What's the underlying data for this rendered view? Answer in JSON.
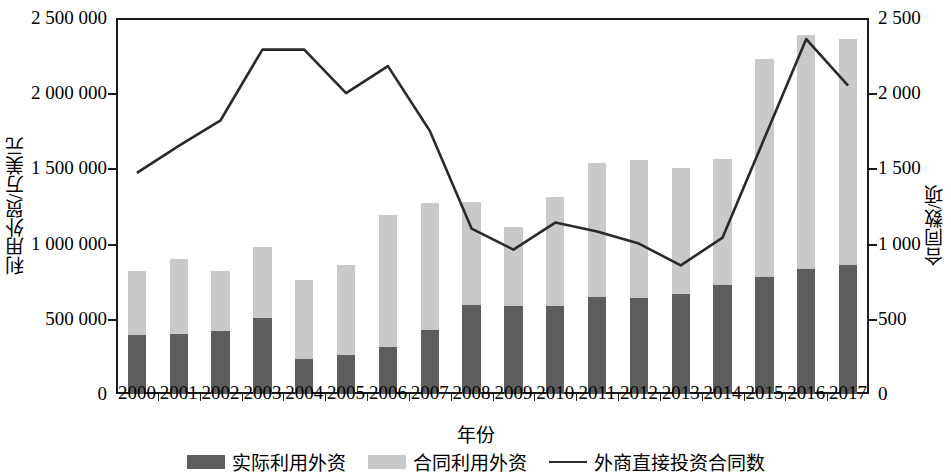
{
  "axes": {
    "y_left_title": "利用外贸/万美元",
    "y_right_title": "合同数/项",
    "x_title": "年份",
    "y_left_ticks": [
      "0",
      "500 000",
      "1 000 000",
      "1 500 000",
      "2 000 000",
      "2 500 000"
    ],
    "y_right_ticks": [
      "0",
      "500",
      "1 000",
      "1 500",
      "2 000",
      "2 500"
    ]
  },
  "legend": {
    "items": [
      {
        "label": "实际利用外资",
        "type": "swatch",
        "color": "#5d5d5d"
      },
      {
        "label": "合同利用外资",
        "type": "swatch",
        "color": "#c9c9c9"
      },
      {
        "label": "外商直接投资合同数",
        "type": "line",
        "color": "#2a2a2a"
      }
    ]
  },
  "chart_data": {
    "type": "bar",
    "title": "",
    "xlabel": "年份",
    "ylabel": "利用外贸/万美元",
    "y2label": "合同数/项",
    "grid": false,
    "legend_position": "bottom",
    "stacked": true,
    "categories": [
      "2000",
      "2001",
      "2002",
      "2003",
      "2004",
      "2005",
      "2006",
      "2007",
      "2008",
      "2009",
      "2010",
      "2011",
      "2012",
      "2013",
      "2014",
      "2015",
      "2016",
      "2017"
    ],
    "ylim": [
      0,
      2500000
    ],
    "y2lim": [
      0,
      2500
    ],
    "series": [
      {
        "name": "实际利用外资",
        "axis": "left",
        "kind": "bar",
        "color": "#5d5d5d",
        "values": [
          390000,
          400000,
          420000,
          505000,
          235000,
          260000,
          310000,
          425000,
          590000,
          585000,
          585000,
          645000,
          640000,
          665000,
          725000,
          780000,
          830000,
          860000
        ]
      },
      {
        "name": "合同利用外资",
        "axis": "left",
        "kind": "bar",
        "color": "#c9c9c9",
        "values": [
          425000,
          495000,
          400000,
          475000,
          525000,
          595000,
          880000,
          845000,
          690000,
          525000,
          725000,
          890000,
          915000,
          835000,
          835000,
          1445000,
          1555000,
          1500000
        ]
      },
      {
        "name": "外商直接投资合同数",
        "axis": "right",
        "kind": "line",
        "color": "#2a2a2a",
        "values": [
          1470,
          1650,
          1820,
          2290,
          2290,
          2000,
          2180,
          1750,
          1100,
          960,
          1140,
          1080,
          1000,
          855,
          1040,
          1700,
          2360,
          2050
        ]
      }
    ],
    "stack_totals": [
      815000,
      895000,
      820000,
      980000,
      760000,
      855000,
      1190000,
      1270000,
      1280000,
      1110000,
      1310000,
      1535000,
      1555000,
      1500000,
      1560000,
      2225000,
      2390000,
      2360000
    ]
  }
}
